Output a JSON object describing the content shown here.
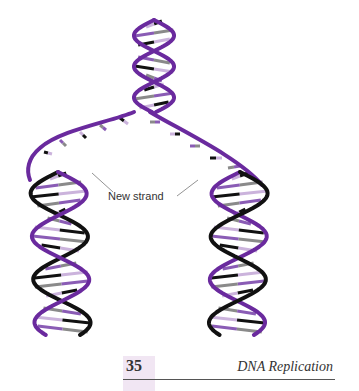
{
  "figure": {
    "annotation": "New strand",
    "colors": {
      "parent_strand": "#6a2a9e",
      "new_strand": "#111111",
      "base_dark": "#111111",
      "base_grey": "#8a8a8a",
      "base_light": "#cbb3dc",
      "base_purple": "#8a5cb5"
    }
  },
  "footer": {
    "page_number": "35",
    "section_title": "DNA Replication",
    "accent": "#f1e6f3"
  }
}
